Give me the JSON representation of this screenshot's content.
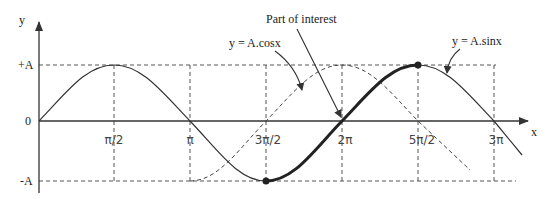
{
  "diagram": {
    "axes": {
      "x_label": "x",
      "y_label": "y",
      "y_ticks": [
        "+A",
        "0",
        "-A"
      ],
      "x_ticks": [
        "π/2",
        "π",
        "3π/2",
        "2π",
        "5π/2",
        "3π"
      ]
    },
    "annotations": {
      "part_of_interest": "Part of interest",
      "cos_label": "y = A.cosx",
      "sin_label": "y = A.sinx"
    },
    "curves": [
      {
        "name": "sine",
        "equation": "y = A.sinx",
        "style": "solid"
      },
      {
        "name": "cosine",
        "equation": "y = A.cosx",
        "style": "dashed"
      },
      {
        "name": "part-of-interest",
        "range": [
          "3π/2",
          "5π/2"
        ],
        "style": "bold"
      }
    ],
    "colors": {
      "line": "#333333",
      "background": "#ffffff"
    }
  }
}
